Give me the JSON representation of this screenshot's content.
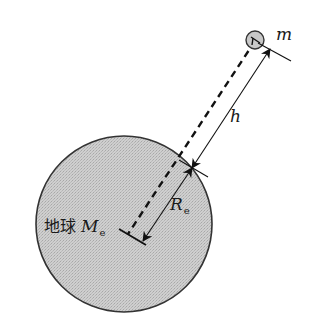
{
  "diagram": {
    "colors": {
      "earth_fill": "#c8c8c8",
      "earth_stroke": "#333333",
      "satellite_fill": "#c8c8c8",
      "line": "#111111",
      "background": "#ffffff"
    },
    "earth": {
      "label_prefix": "地球",
      "mass_symbol": "M",
      "mass_subscript": "e",
      "center": [
        124,
        224
      ],
      "radius": 88
    },
    "satellite": {
      "mass_symbol": "m",
      "center": [
        255,
        40
      ],
      "radius": 9
    },
    "dimensions": {
      "height": {
        "symbol": "h",
        "from": [
          192,
          168
        ],
        "to": [
          270,
          49
        ]
      },
      "earth_radius": {
        "symbol": "R",
        "subscript": "e",
        "from": [
          192,
          168
        ],
        "to": [
          143,
          241
        ]
      }
    },
    "dashed_line": {
      "from": [
        255,
        41
      ],
      "to": [
        128,
        234
      ]
    }
  }
}
